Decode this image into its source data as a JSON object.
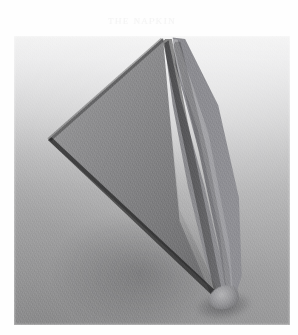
{
  "page": {
    "background_color": "#fefefe",
    "ghost_text": "ᴛʜᴇ ɴᴀᴘᴋɪɴ",
    "ghost_text_color": "#f4f4f4"
  },
  "photo": {
    "caption": "",
    "subject": "folded cloth napkin",
    "description": "Grayscale photograph of a cloth napkin folded into a tall triangular cone shape, standing apex-up on a plain surface",
    "orientation": "portrait",
    "bounds": {
      "left": 14,
      "top": 36,
      "width": 276,
      "height": 289
    },
    "background": {
      "type": "vertical-gradient",
      "top_color": "#f3f3f3",
      "bottom_color": "#9a9a9b"
    },
    "napkin": {
      "fabric_tone": "#86868a",
      "shadow_tone": "#1e1e22",
      "highlight_tone": "#b4b4b6",
      "parts": [
        {
          "name": "left-wing",
          "label": "left flat triangular panel"
        },
        {
          "name": "cone-body",
          "label": "inner folded cone body"
        },
        {
          "name": "cone-sheet",
          "label": "right conical sheet"
        },
        {
          "name": "ridge",
          "label": "tall fold ridge highlight"
        },
        {
          "name": "crease",
          "label": "central crease line"
        },
        {
          "name": "tip",
          "label": "bottom tip of the cone"
        }
      ],
      "apex": {
        "x_pct": 56,
        "y_pct": 1
      },
      "left_point": {
        "x_pct": 12,
        "y_pct": 36
      },
      "bottom_tip": {
        "x_pct": 77,
        "y_pct": 91
      }
    },
    "grain": {
      "enabled": true,
      "strength": "medium"
    }
  }
}
